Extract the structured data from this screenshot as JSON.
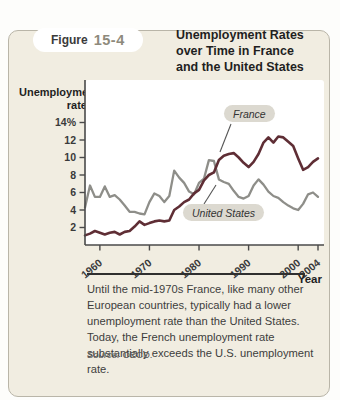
{
  "page": {
    "header_fragment": "unemployment rate today."
  },
  "figure": {
    "tab": {
      "word": "Figure",
      "number": "15-4"
    },
    "title": "Unemployment Rates\nover Time in France\nand the United States"
  },
  "chart_data": {
    "type": "line",
    "title": "Unemployment Rates over Time in France and the United States",
    "y_axis_label": "Unemployment\nrate",
    "x_axis_label": "Year",
    "x_range": [
      1957,
      2004
    ],
    "y_range": [
      0,
      19
    ],
    "grid": false,
    "y_ticks": [
      {
        "value": 2,
        "label": "2"
      },
      {
        "value": 4,
        "label": "4"
      },
      {
        "value": 6,
        "label": "6"
      },
      {
        "value": 8,
        "label": "8"
      },
      {
        "value": 10,
        "label": "10"
      },
      {
        "value": 12,
        "label": "12"
      },
      {
        "value": 14,
        "label": "14%"
      }
    ],
    "x_ticks": [
      {
        "value": 1960,
        "label": "1960"
      },
      {
        "value": 1970,
        "label": "1970"
      },
      {
        "value": 1980,
        "label": "1980"
      },
      {
        "value": 1990,
        "label": "1990"
      },
      {
        "value": 2000,
        "label": "2000"
      },
      {
        "value": 2004,
        "label": "2004"
      }
    ],
    "years": [
      1957,
      1958,
      1959,
      1960,
      1961,
      1962,
      1963,
      1964,
      1965,
      1966,
      1967,
      1968,
      1969,
      1970,
      1971,
      1972,
      1973,
      1974,
      1975,
      1976,
      1977,
      1978,
      1979,
      1980,
      1981,
      1982,
      1983,
      1984,
      1985,
      1986,
      1987,
      1988,
      1989,
      1990,
      1991,
      1992,
      1993,
      1994,
      1995,
      1996,
      1997,
      1998,
      1999,
      2000,
      2001,
      2002,
      2003,
      2004
    ],
    "series": [
      {
        "name": "France",
        "color": "#5f2e35",
        "values": [
          1.1,
          1.3,
          1.6,
          1.4,
          1.2,
          1.4,
          1.5,
          1.2,
          1.5,
          1.6,
          2.1,
          2.7,
          2.3,
          2.5,
          2.7,
          2.8,
          2.7,
          2.8,
          4.0,
          4.4,
          4.9,
          5.2,
          5.9,
          6.3,
          7.4,
          8.0,
          8.3,
          9.7,
          10.2,
          10.4,
          10.5,
          10.0,
          9.4,
          8.9,
          9.5,
          10.4,
          11.7,
          12.3,
          11.7,
          12.4,
          12.3,
          11.8,
          11.3,
          9.9,
          8.6,
          8.9,
          9.5,
          9.9
        ]
      },
      {
        "name": "United States",
        "color": "#8e8e89",
        "values": [
          4.3,
          6.8,
          5.5,
          5.5,
          6.7,
          5.5,
          5.7,
          5.2,
          4.5,
          3.8,
          3.8,
          3.6,
          3.5,
          4.9,
          5.9,
          5.6,
          4.9,
          5.6,
          8.5,
          7.7,
          7.1,
          6.1,
          5.8,
          7.1,
          7.6,
          9.7,
          9.6,
          7.5,
          7.2,
          7.0,
          6.2,
          5.5,
          5.3,
          5.6,
          6.8,
          7.5,
          6.9,
          6.1,
          5.6,
          5.4,
          4.9,
          4.5,
          4.2,
          4.0,
          4.7,
          5.8,
          6.0,
          5.5
        ]
      }
    ],
    "annotation_colors": {
      "pill_background": "#dcd9d0",
      "axis": "#4a4a4a",
      "plot_background": "#ffffff",
      "box_background": "#f1ede1"
    }
  },
  "caption": {
    "text": "Until the mid-1970s France, like many other European countries, typically had a lower unemployment rate than the United States. Today, the French unemployment rate substantially exceeds the U.S. unemployment rate.",
    "source_prefix": "Source:",
    "source_text": "OECD."
  }
}
